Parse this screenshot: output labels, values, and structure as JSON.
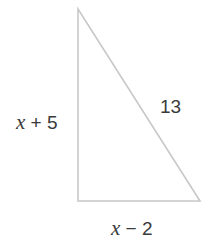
{
  "diagram": {
    "type": "right-triangle",
    "line_color": "#c8c8c8",
    "text_color": "#3a3a3a",
    "vertices": {
      "top": [
        78,
        9
      ],
      "bottom_left": [
        78,
        201
      ],
      "bottom_right": [
        200,
        201
      ]
    },
    "labels": {
      "left_leg": {
        "variable": "x",
        "rest": " + 5"
      },
      "hypotenuse": {
        "text": "13"
      },
      "bottom_leg": {
        "variable": "x",
        "rest": " − 2"
      }
    }
  }
}
